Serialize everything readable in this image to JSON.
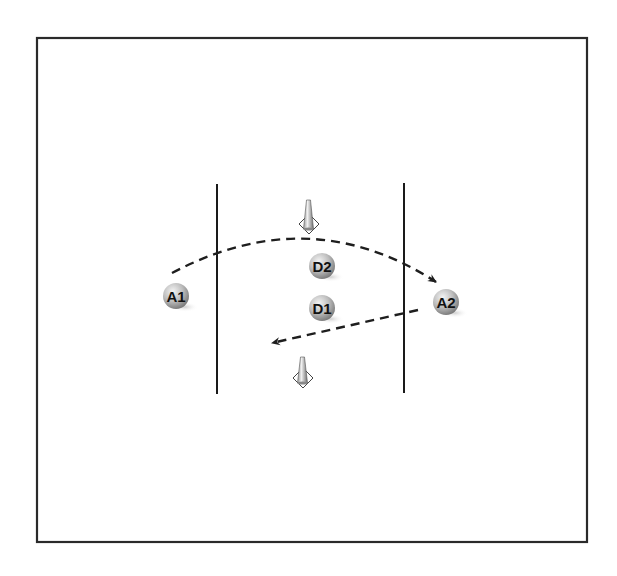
{
  "diagram": {
    "type": "drill-diagram",
    "colors": {
      "frame": "#2a2a2a",
      "lines": "#1a1a1a",
      "path": "#1e1e1e",
      "player_light": "#f2f2f2",
      "player_mid": "#b8b8b8",
      "player_dark": "#7a7a7a",
      "shadow": "#d9d9d9",
      "cone_light": "#eeeeee",
      "cone_dark": "#777777"
    },
    "frame": {
      "x": 37,
      "y": 38,
      "width": 550,
      "height": 504
    },
    "boundary_lines": [
      {
        "id": "left-line",
        "x": 217,
        "y1": 184,
        "y2": 394
      },
      {
        "id": "right-line",
        "x": 404,
        "y1": 183,
        "y2": 393
      }
    ],
    "cones": [
      {
        "id": "cone-top",
        "x": 308,
        "y": 200,
        "base_y": 224
      },
      {
        "id": "cone-bottom",
        "x": 302,
        "y": 357,
        "base_y": 378
      }
    ],
    "players": [
      {
        "id": "A1",
        "label": "A1",
        "cx": 176,
        "cy": 296,
        "team": "attack"
      },
      {
        "id": "D2",
        "label": "D2",
        "cx": 322,
        "cy": 266,
        "team": "defense"
      },
      {
        "id": "D1",
        "label": "D1",
        "cx": 322,
        "cy": 308,
        "team": "defense"
      },
      {
        "id": "A2",
        "label": "A2",
        "cx": 446,
        "cy": 302,
        "team": "attack"
      }
    ],
    "paths": [
      {
        "id": "pass-a1-to-a2",
        "from": "A1",
        "to": "A2",
        "style": "dashed",
        "d": "M 172 273 Q 310 200 436 282"
      },
      {
        "id": "run-a2-back",
        "from": "A2",
        "to": "left",
        "style": "dashed",
        "d": "M 418 310 L 272 343"
      }
    ]
  }
}
